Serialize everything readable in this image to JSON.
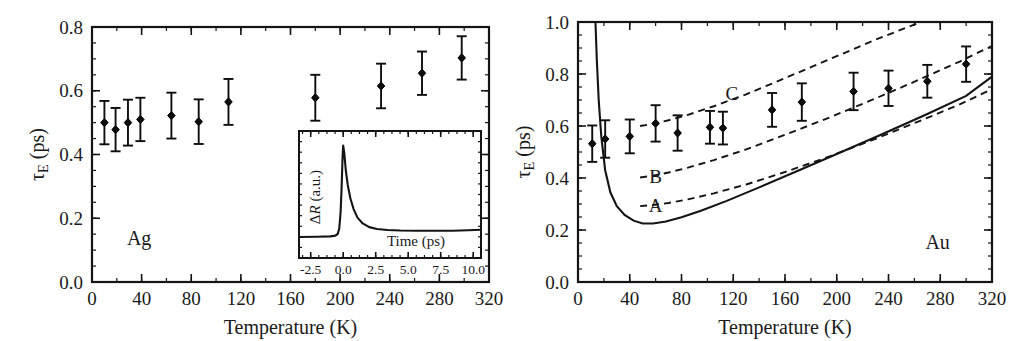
{
  "figure": {
    "panels": [
      "Ag",
      "Au"
    ],
    "shared_xlabel": "Temperature (K)",
    "shared_ylabel": "τ",
    "ylabel_sub": "E",
    "ylabel_unit": " (ps)"
  },
  "chart_data": [
    {
      "id": "panel-ag",
      "type": "scatter",
      "title": "",
      "annotation": "Ag",
      "xlabel": "Temperature (K)",
      "ylabel": "τE (ps)",
      "xlim": [
        0,
        320
      ],
      "ylim": [
        0.0,
        0.8
      ],
      "xticks": [
        0,
        40,
        80,
        120,
        160,
        200,
        240,
        280,
        320
      ],
      "xticklabels": [
        "0",
        "40",
        "80",
        "120",
        "160",
        "200",
        "240",
        "280",
        "320"
      ],
      "yticks": [
        0.0,
        0.2,
        0.4,
        0.6,
        0.8
      ],
      "yticklabels": [
        "0.0",
        "0.2",
        "0.4",
        "0.6",
        "0.8"
      ],
      "x_minor_step": 20,
      "y_minor_step": 0.05,
      "grid": false,
      "legend": "none",
      "series": [
        {
          "name": "Ag measured electron-phonon relaxation time",
          "marker": "filled-diamond-circle",
          "x": [
            10,
            19,
            29,
            39,
            64,
            86,
            110,
            180,
            233,
            266,
            298
          ],
          "y": [
            0.5,
            0.478,
            0.5,
            0.51,
            0.522,
            0.503,
            0.565,
            0.578,
            0.615,
            0.655,
            0.703
          ],
          "yerr": [
            0.068,
            0.068,
            0.072,
            0.068,
            0.072,
            0.07,
            0.072,
            0.072,
            0.07,
            0.068,
            0.068
          ]
        }
      ],
      "inset": {
        "id": "inset-transient",
        "type": "line",
        "xlabel": "Time (ps)",
        "ylabel": "ΔR (a.u.)",
        "xlim": [
          -3.4,
          10.6
        ],
        "ylim": [
          0.0,
          1.0
        ],
        "xticks": [
          -2.5,
          0.0,
          2.5,
          5.0,
          7.5,
          10.0
        ],
        "xticklabels": [
          "-2.5",
          "0.0",
          "2.5",
          "5.0",
          "7.5",
          "10.0"
        ],
        "x_minor_step": 0.625,
        "y_minor_step": 0.0833,
        "trace_x": [
          -3.4,
          -2.0,
          -1.0,
          -0.6,
          -0.42,
          -0.3,
          -0.2,
          -0.12,
          -0.05,
          0.0,
          0.08,
          0.2,
          0.35,
          0.55,
          0.8,
          1.1,
          1.5,
          2.0,
          2.6,
          3.4,
          4.4,
          5.6,
          7.0,
          8.4,
          9.6,
          10.6
        ],
        "trace_y": [
          0.165,
          0.167,
          0.17,
          0.176,
          0.19,
          0.235,
          0.36,
          0.56,
          0.79,
          0.885,
          0.83,
          0.69,
          0.575,
          0.47,
          0.385,
          0.318,
          0.272,
          0.243,
          0.228,
          0.22,
          0.216,
          0.214,
          0.214,
          0.215,
          0.218,
          0.222
        ]
      }
    },
    {
      "id": "panel-au",
      "type": "scatter",
      "title": "",
      "annotation": "Au",
      "xlabel": "Temperature (K)",
      "ylabel": "τE (ps)",
      "xlim": [
        0,
        320
      ],
      "ylim": [
        0.0,
        1.0
      ],
      "xticks": [
        0,
        40,
        80,
        120,
        160,
        200,
        240,
        280,
        320
      ],
      "xticklabels": [
        "0",
        "40",
        "80",
        "120",
        "160",
        "200",
        "240",
        "280",
        "320"
      ],
      "yticks": [
        0.0,
        0.2,
        0.4,
        0.6,
        0.8,
        1.0
      ],
      "yticklabels": [
        "0.0",
        "0.2",
        "0.4",
        "0.6",
        "0.8",
        "1.0"
      ],
      "x_minor_step": 20,
      "y_minor_step": 0.05,
      "grid": false,
      "legend": "none",
      "series": [
        {
          "name": "Au measured electron-phonon relaxation time",
          "marker": "filled-diamond-circle",
          "x": [
            11,
            21,
            40,
            60,
            77,
            102,
            112,
            150,
            173,
            213,
            240,
            270,
            300
          ],
          "y": [
            0.532,
            0.55,
            0.56,
            0.61,
            0.573,
            0.595,
            0.592,
            0.662,
            0.692,
            0.733,
            0.745,
            0.772,
            0.838
          ],
          "yerr": [
            0.07,
            0.072,
            0.065,
            0.07,
            0.068,
            0.063,
            0.063,
            0.065,
            0.072,
            0.072,
            0.068,
            0.063,
            0.068
          ]
        }
      ],
      "model_curves": [
        {
          "label": "",
          "style": "solid",
          "name": "two-temperature model baseline",
          "x": [
            13.5,
            14.5,
            16,
            18,
            21,
            25,
            30,
            36,
            43,
            50,
            58,
            68,
            80,
            95,
            115,
            140,
            170,
            200,
            235,
            270,
            300,
            320
          ],
          "y": [
            1.0,
            0.86,
            0.7,
            0.56,
            0.43,
            0.345,
            0.292,
            0.258,
            0.236,
            0.225,
            0.225,
            0.233,
            0.249,
            0.274,
            0.312,
            0.364,
            0.428,
            0.492,
            0.568,
            0.646,
            0.716,
            0.79
          ]
        },
        {
          "label": "A",
          "style": "dashed",
          "name": "model curve A",
          "x": [
            48,
            58,
            70,
            85,
            105,
            130,
            160,
            195,
            230,
            265,
            295,
            320
          ],
          "y": [
            0.292,
            0.296,
            0.304,
            0.318,
            0.341,
            0.375,
            0.423,
            0.484,
            0.551,
            0.621,
            0.683,
            0.742
          ]
        },
        {
          "label": "B",
          "style": "dashed",
          "name": "model curve B",
          "x": [
            48,
            58,
            70,
            85,
            105,
            130,
            160,
            195,
            230,
            265,
            295,
            320
          ],
          "y": [
            0.402,
            0.409,
            0.421,
            0.44,
            0.469,
            0.51,
            0.566,
            0.634,
            0.706,
            0.781,
            0.848,
            0.908
          ]
        },
        {
          "label": "C",
          "style": "dashed",
          "name": "model curve C",
          "x": [
            48,
            58,
            70,
            85,
            105,
            130,
            160,
            195,
            230,
            265,
            295,
            320
          ],
          "y": [
            0.6,
            0.608,
            0.622,
            0.643,
            0.676,
            0.722,
            0.784,
            0.858,
            0.932,
            1.0,
            1.0,
            1.0
          ]
        }
      ],
      "curve_labels": [
        {
          "text": "C",
          "x": 119,
          "y": 0.722
        },
        {
          "text": "B",
          "x": 60,
          "y": 0.405
        },
        {
          "text": "A",
          "x": 60,
          "y": 0.292
        }
      ]
    }
  ]
}
